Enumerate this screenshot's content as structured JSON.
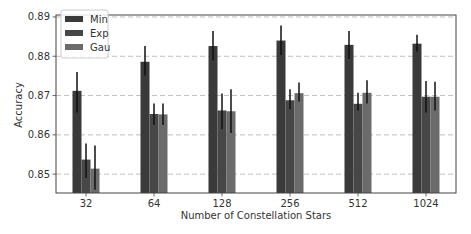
{
  "chart_data": {
    "type": "bar",
    "title": "",
    "xlabel": "Number of Constellation Stars",
    "ylabel": "Accuracy",
    "categories": [
      "32",
      "64",
      "128",
      "256",
      "512",
      "1024"
    ],
    "ylim": [
      0.8452,
      0.8905
    ],
    "yticks": [
      0.85,
      0.86,
      0.87,
      0.88,
      0.89
    ],
    "ytick_labels": [
      "0.85",
      "0.86",
      "0.87",
      "0.88",
      "0.89"
    ],
    "grid": {
      "axis": "y",
      "style": "dashed"
    },
    "legend": {
      "position": "upper left",
      "entries": [
        "Min",
        "Exp",
        "Gau"
      ]
    },
    "series": [
      {
        "name": "Min",
        "color": "#3a3a3a",
        "values": [
          0.8712,
          0.8786,
          0.8826,
          0.884,
          0.8829,
          0.8832
        ],
        "err_low": [
          0.8657,
          0.8751,
          0.8789,
          0.8803,
          0.8793,
          0.8812
        ],
        "err_high": [
          0.876,
          0.8826,
          0.8864,
          0.8878,
          0.8864,
          0.8855
        ]
      },
      {
        "name": "Exp",
        "color": "#474747",
        "values": [
          0.8537,
          0.8653,
          0.8662,
          0.8688,
          0.8679,
          0.8697
        ],
        "err_low": [
          0.849,
          0.8625,
          0.8614,
          0.8665,
          0.8662,
          0.8657
        ],
        "err_high": [
          0.8578,
          0.868,
          0.8705,
          0.8716,
          0.8707,
          0.8737
        ]
      },
      {
        "name": "Gau",
        "color": "#6b6b6b",
        "values": [
          0.8514,
          0.8652,
          0.866,
          0.8706,
          0.8707,
          0.8697
        ],
        "err_low": [
          0.846,
          0.8625,
          0.8605,
          0.8685,
          0.868,
          0.8662
        ],
        "err_high": [
          0.8573,
          0.868,
          0.8716,
          0.8733,
          0.8739,
          0.8735
        ]
      }
    ]
  }
}
